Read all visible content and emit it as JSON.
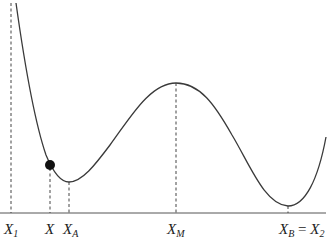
{
  "figure": {
    "colors": {
      "curve": "#3a3a3a",
      "ball": "#111111",
      "guides": "#444444"
    },
    "labels": {
      "x1": {
        "main": "X",
        "sub": "1"
      },
      "x": {
        "main": "X",
        "sub": ""
      },
      "xa": {
        "main": "X",
        "sub": "A"
      },
      "xm": {
        "main": "X",
        "sub": "M"
      },
      "xb": {
        "main": "X",
        "sub": "B",
        "eq": " = ",
        "main2": "X",
        "sub2": "2"
      }
    },
    "points": [
      {
        "id": "x1",
        "role": "left boundary"
      },
      {
        "id": "x",
        "role": "ball position"
      },
      {
        "id": "xa",
        "role": "local minimum"
      },
      {
        "id": "xm",
        "role": "local maximum"
      },
      {
        "id": "xb",
        "role": "global minimum / right boundary"
      }
    ]
  }
}
